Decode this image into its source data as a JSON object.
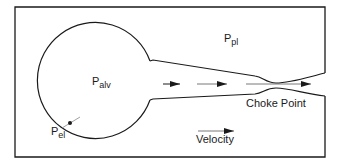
{
  "diagram": {
    "title": "",
    "colors": {
      "stroke": "#1a1a1a",
      "background": "#ffffff"
    },
    "labels": {
      "pleural_pressure": {
        "main": "P",
        "sub": "pl"
      },
      "alveolar_pressure": {
        "main": "P",
        "sub": "alv"
      },
      "elastic_recoil_pressure": {
        "main": "P",
        "sub": "el"
      },
      "choke_point": "Choke Point",
      "velocity": "Velocity"
    },
    "elements": [
      {
        "id": "chest-wall-frame",
        "type": "open rectangle",
        "note": "opening on right where airway exits"
      },
      {
        "id": "alveolus",
        "type": "circle"
      },
      {
        "id": "airway",
        "type": "tapering tube",
        "note": "narrows at choke point"
      },
      {
        "id": "flow-arrows",
        "type": "arrows",
        "count": 3,
        "note": "increasing length toward choke point"
      },
      {
        "id": "velocity-legend-arrow",
        "type": "arrow"
      },
      {
        "id": "recoil-marker",
        "type": "short tick across alveolar wall"
      }
    ]
  }
}
